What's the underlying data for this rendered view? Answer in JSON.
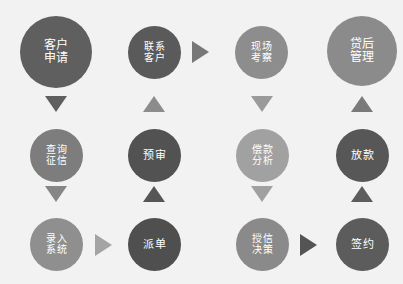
{
  "header": {
    "caption": ""
  },
  "canvas": {
    "width": 403,
    "height": 284,
    "background": "#f2f2f2"
  },
  "palette": {
    "dark_gray": "#595959",
    "mid_gray": "#6f6f6f",
    "light_gray": "#949494",
    "pale_gray": "#a8a8a8",
    "text": "#ffffff"
  },
  "diagram": {
    "type": "flowchart",
    "columns": 4,
    "rows": 3,
    "nodes": [
      {
        "id": "n1",
        "label": "客户\n申请",
        "label_text": "客户申请",
        "row": 1,
        "col": 1,
        "x": 20,
        "y": 16,
        "size": 72,
        "font_size": 12,
        "color": "#5f5f5f"
      },
      {
        "id": "n2",
        "label": "联系\n客户",
        "label_text": "联系客户",
        "row": 1,
        "col": 2,
        "x": 128,
        "y": 26,
        "size": 53,
        "font_size": 10,
        "color": "#5a5a5a"
      },
      {
        "id": "n3",
        "label": "现场\n考察",
        "label_text": "现场考察",
        "row": 1,
        "col": 3,
        "x": 235,
        "y": 26,
        "size": 53,
        "font_size": 10,
        "color": "#8d8d8d"
      },
      {
        "id": "n4",
        "label": "贷后\n管理",
        "label_text": "贷后管理",
        "row": 1,
        "col": 4,
        "x": 327,
        "y": 16,
        "size": 70,
        "font_size": 12,
        "color": "#8b8b8b"
      },
      {
        "id": "n5",
        "label": "查询\n征信",
        "label_text": "查询征信",
        "row": 2,
        "col": 1,
        "x": 30,
        "y": 129,
        "size": 53,
        "font_size": 10,
        "color": "#7d7d7d"
      },
      {
        "id": "n6",
        "label": "预审",
        "label_text": "预审",
        "row": 2,
        "col": 2,
        "x": 128,
        "y": 129,
        "size": 53,
        "font_size": 11,
        "color": "#525252"
      },
      {
        "id": "n7",
        "label": "偿款\n分析",
        "label_text": "偿款分析",
        "row": 2,
        "col": 3,
        "x": 236,
        "y": 129,
        "size": 53,
        "font_size": 10,
        "color": "#a1a1a1"
      },
      {
        "id": "n8",
        "label": "放款",
        "label_text": "放款",
        "row": 2,
        "col": 4,
        "x": 336,
        "y": 129,
        "size": 53,
        "font_size": 11,
        "color": "#575757"
      },
      {
        "id": "n9",
        "label": "录入\n系统",
        "label_text": "录入系统",
        "row": 3,
        "col": 1,
        "x": 30,
        "y": 218,
        "size": 53,
        "font_size": 10,
        "color": "#8f8f8f"
      },
      {
        "id": "n10",
        "label": "派单",
        "label_text": "派单",
        "row": 3,
        "col": 2,
        "x": 128,
        "y": 218,
        "size": 53,
        "font_size": 11,
        "color": "#4f4f4f"
      },
      {
        "id": "n11",
        "label": "授信\n决策",
        "label_text": "授信决策",
        "row": 3,
        "col": 3,
        "x": 236,
        "y": 218,
        "size": 53,
        "font_size": 10,
        "color": "#8a8a8a"
      },
      {
        "id": "n12",
        "label": "签约",
        "label_text": "签约",
        "row": 3,
        "col": 4,
        "x": 336,
        "y": 218,
        "size": 53,
        "font_size": 11,
        "color": "#5c5c5c"
      }
    ],
    "arrows": [
      {
        "id": "a1",
        "from": "n1",
        "to": "n5",
        "direction": "down",
        "x": 45,
        "y": 96,
        "color": "#5f5f5f"
      },
      {
        "id": "a2",
        "from": "n5",
        "to": "n9",
        "direction": "down",
        "x": 45,
        "y": 186,
        "color": "#868686"
      },
      {
        "id": "a3",
        "from": "n9",
        "to": "n10",
        "direction": "right",
        "x": 95,
        "y": 234,
        "color": "#a4a4a4"
      },
      {
        "id": "a4",
        "from": "n10",
        "to": "n6",
        "direction": "up",
        "x": 143,
        "y": 186,
        "color": "#565656"
      },
      {
        "id": "a5",
        "from": "n6",
        "to": "n2",
        "direction": "up",
        "x": 143,
        "y": 96,
        "color": "#8c8c8c"
      },
      {
        "id": "a6",
        "from": "n2",
        "to": "n3",
        "direction": "right",
        "x": 192,
        "y": 41,
        "color": "#777777"
      },
      {
        "id": "a7",
        "from": "n3",
        "to": "n7",
        "direction": "down",
        "x": 251,
        "y": 96,
        "color": "#9a9a9a"
      },
      {
        "id": "a8",
        "from": "n7",
        "to": "n11",
        "direction": "down",
        "x": 251,
        "y": 186,
        "color": "#a0a0a0"
      },
      {
        "id": "a9",
        "from": "n11",
        "to": "n12",
        "direction": "right",
        "x": 300,
        "y": 234,
        "color": "#545454"
      },
      {
        "id": "a10",
        "from": "n12",
        "to": "n8",
        "direction": "up",
        "x": 351,
        "y": 186,
        "color": "#5d5d5d"
      },
      {
        "id": "a11",
        "from": "n8",
        "to": "n4",
        "direction": "up",
        "x": 351,
        "y": 96,
        "color": "#7a7a7a"
      }
    ]
  }
}
